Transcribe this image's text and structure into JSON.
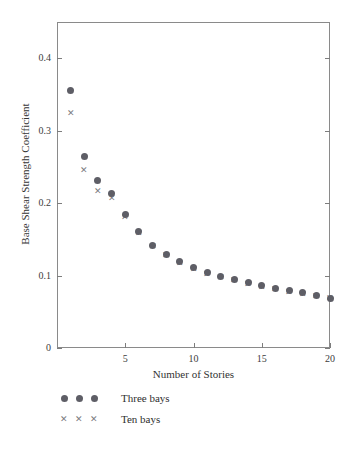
{
  "chart_data": {
    "type": "scatter",
    "title": "",
    "xlabel": "Number of Stories",
    "ylabel": "Base Shear Strength Coefficient",
    "xlim": [
      0,
      20
    ],
    "ylim": [
      0,
      0.45
    ],
    "xticks": [
      5,
      10,
      15,
      20
    ],
    "xtick_labels": [
      "5",
      "10",
      "15",
      "20"
    ],
    "yticks": [
      0,
      0.1,
      0.2,
      0.3,
      0.4
    ],
    "ytick_labels": [
      "0",
      "0.1",
      "0.2",
      "0.3",
      "0.4"
    ],
    "grid": false,
    "legend_position": "below-axes-left",
    "x": [
      1,
      2,
      3,
      4,
      5,
      6,
      7,
      8,
      9,
      10,
      11,
      12,
      13,
      14,
      15,
      16,
      17,
      18,
      19,
      20
    ],
    "series": [
      {
        "name": "Three bays",
        "marker": "circle",
        "color": "#5e5e66",
        "values": [
          0.356,
          0.265,
          0.231,
          0.213,
          0.184,
          0.161,
          0.142,
          0.129,
          0.119,
          0.111,
          0.104,
          0.099,
          0.095,
          0.09,
          0.086,
          0.082,
          0.079,
          0.076,
          0.072,
          0.069
        ]
      },
      {
        "name": "Ten bays",
        "marker": "x",
        "color": "#7b7b80",
        "values": [
          0.324,
          0.245,
          0.216,
          0.206,
          0.18,
          0.158,
          0.14,
          0.127,
          0.117,
          0.109,
          0.102,
          0.097,
          0.093,
          0.088,
          0.084,
          0.081,
          0.077,
          0.074,
          0.071,
          0.068
        ]
      }
    ]
  },
  "legend": {
    "entries": [
      {
        "label": "Three bays",
        "marker": "circle"
      },
      {
        "label": "Ten bays",
        "marker": "x"
      }
    ]
  }
}
